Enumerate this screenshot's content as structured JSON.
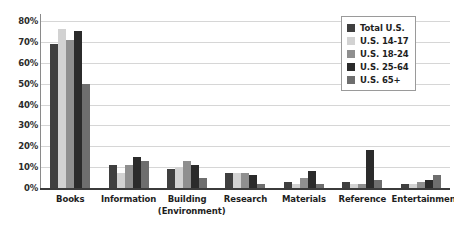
{
  "chart_data": {
    "type": "bar",
    "title": "",
    "subtitle": "",
    "xlabel": "",
    "ylabel": "",
    "ylim": [
      0,
      80
    ],
    "ytick_labels": [
      "80%",
      "70%",
      "60%",
      "50%",
      "40%",
      "30%",
      "20%",
      "10%",
      "0%"
    ],
    "ytick_values": [
      80,
      70,
      60,
      50,
      40,
      30,
      20,
      10,
      0
    ],
    "grid": true,
    "legend_position": "top-right",
    "categories": [
      "Books",
      "Information",
      "Building (Environment)",
      "Research",
      "Materials",
      "Reference",
      "Entertainment"
    ],
    "category_lines": [
      [
        "Books"
      ],
      [
        "Information"
      ],
      [
        "Building",
        "(Environment)"
      ],
      [
        "Research"
      ],
      [
        "Materials"
      ],
      [
        "Reference"
      ],
      [
        "Entertainment"
      ]
    ],
    "series": [
      {
        "name": "Total U.S.",
        "color": "#3f3f3f",
        "values": [
          69,
          11,
          9,
          7,
          3,
          3,
          2
        ]
      },
      {
        "name": "U.S. 14-17",
        "color": "#d2d2d2",
        "values": [
          76,
          7,
          10,
          7,
          2,
          2,
          2
        ]
      },
      {
        "name": "U.S. 18-24",
        "color": "#8f8f8f",
        "values": [
          71,
          11,
          13,
          7,
          5,
          2,
          3
        ]
      },
      {
        "name": "U.S. 25-64",
        "color": "#2b2b2b",
        "values": [
          75,
          15,
          11,
          6,
          8,
          18,
          4
        ]
      },
      {
        "name": "U.S. 65+",
        "color": "#6e6e6e",
        "values": [
          50,
          13,
          5,
          2,
          2,
          4,
          6
        ]
      }
    ]
  },
  "legend": {
    "entries": [
      {
        "label": "Total U.S."
      },
      {
        "label": "U.S. 14-17"
      },
      {
        "label": "U.S. 18-24"
      },
      {
        "label": "U.S. 25-64"
      },
      {
        "label": "U.S. 65+"
      }
    ]
  }
}
